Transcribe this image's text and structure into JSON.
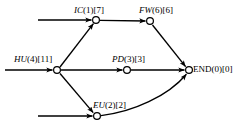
{
  "diagram": {
    "type": "activity-network-diagram",
    "background_color": "#ffffff",
    "stroke_color": "#000000",
    "node_fill_color": "#ffffff",
    "nodes": [
      {
        "id": "ic",
        "code": "IC",
        "duration": "(1)",
        "slack": "[7]",
        "label": "IC(1)[7]",
        "cx": 96,
        "cy": 20
      },
      {
        "id": "fw",
        "code": "FW",
        "duration": "(6)",
        "slack": "[6]",
        "label": "FW(6)[6]",
        "cx": 150,
        "cy": 21
      },
      {
        "id": "hu",
        "code": "HU",
        "duration": "(4)",
        "slack": "[11]",
        "label": "HU(4)[11]",
        "cx": 57,
        "cy": 70
      },
      {
        "id": "pd",
        "code": "PD",
        "duration": "(3)",
        "slack": "[3]",
        "label": "PD(3)[3]",
        "cx": 127,
        "cy": 70
      },
      {
        "id": "end",
        "code": "END",
        "duration": "(0)",
        "slack": "[0]",
        "label": "END(0)[0]",
        "cx": 189,
        "cy": 70
      },
      {
        "id": "eu",
        "code": "EU",
        "duration": "(2)",
        "slack": "[2]",
        "label": "EU(2)[2]",
        "cx": 97,
        "cy": 116
      }
    ],
    "edges": [
      {
        "id": "edge-start-ic",
        "from": "start-top",
        "to": "ic",
        "shape": "straight"
      },
      {
        "id": "edge-ic-fw",
        "from": "ic",
        "to": "fw",
        "shape": "straight"
      },
      {
        "id": "edge-hu-ic",
        "from": "hu",
        "to": "ic",
        "shape": "straight"
      },
      {
        "id": "edge-start-hu",
        "from": "start-middle",
        "to": "hu",
        "shape": "straight"
      },
      {
        "id": "edge-hu-pd",
        "from": "hu",
        "to": "pd",
        "shape": "straight"
      },
      {
        "id": "edge-pd-end",
        "from": "pd",
        "to": "end",
        "shape": "straight"
      },
      {
        "id": "edge-fw-end",
        "from": "fw",
        "to": "end",
        "shape": "straight"
      },
      {
        "id": "edge-hu-eu",
        "from": "hu",
        "to": "eu",
        "shape": "straight"
      },
      {
        "id": "edge-start-eu",
        "from": "start-bottom",
        "to": "eu",
        "shape": "straight"
      },
      {
        "id": "edge-eu-end",
        "from": "eu",
        "to": "end",
        "shape": "curved"
      }
    ]
  }
}
